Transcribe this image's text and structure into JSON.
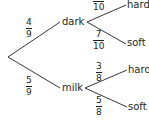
{
  "tree": {
    "root": "",
    "level1": [
      {
        "label": "dark",
        "probability": {
          "numerator": "4",
          "denominator": "9"
        },
        "children": [
          {
            "label": "hard",
            "probability": {
              "numerator": "3",
              "denominator": "10"
            }
          },
          {
            "label": "soft",
            "probability": {
              "numerator": "7",
              "denominator": "10"
            }
          }
        ]
      },
      {
        "label": "milk",
        "probability": {
          "numerator": "5",
          "denominator": "9"
        },
        "children": [
          {
            "label": "hard",
            "probability": {
              "numerator": "3",
              "denominator": "8"
            }
          },
          {
            "label": "soft",
            "probability": {
              "numerator": "5",
              "denominator": "8"
            }
          }
        ]
      }
    ]
  },
  "colors": {
    "line": "#231f20",
    "text": "#231f20"
  }
}
